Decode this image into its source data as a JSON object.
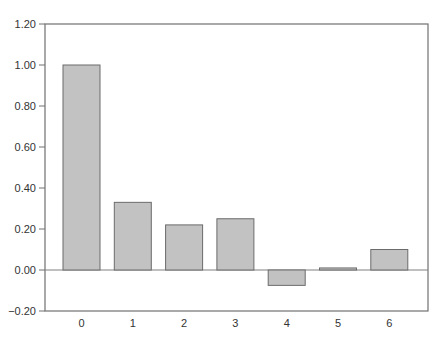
{
  "chart_data": {
    "type": "bar",
    "title": "",
    "xlabel": "",
    "ylabel": "",
    "categories": [
      "0",
      "1",
      "2",
      "3",
      "4",
      "5",
      "6"
    ],
    "values": [
      1.0,
      0.33,
      0.22,
      0.25,
      -0.075,
      0.01,
      0.1
    ],
    "ylim": [
      -0.2,
      1.2
    ],
    "yticks": [
      "-0.20",
      "0.00",
      "0.20",
      "0.40",
      "0.60",
      "0.80",
      "1.00",
      "1.20"
    ],
    "grid": false,
    "legend": null
  },
  "colors": {
    "bar_fill": "#c2c2c2",
    "bar_stroke": "#6b6b6b",
    "axis": "#707070",
    "zero_line": "#808080",
    "text": "#333333"
  }
}
